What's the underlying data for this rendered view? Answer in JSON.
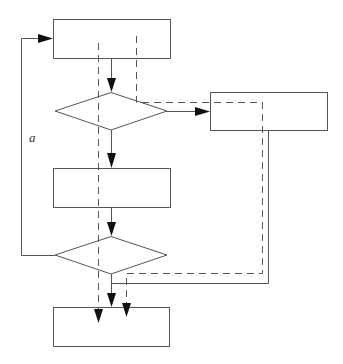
{
  "diagram": {
    "type": "flowchart",
    "width": 343,
    "height": 364,
    "colors": {
      "stroke": "#555555",
      "arrowhead": "#111111",
      "background": "#ffffff",
      "label": "#333333"
    },
    "nodes": [
      {
        "id": "process-1",
        "shape": "rectangle",
        "x": 53,
        "y": 19,
        "w": 117,
        "h": 39,
        "label": ""
      },
      {
        "id": "decision-1",
        "shape": "diamond",
        "cx": 111,
        "cy": 111,
        "w": 112,
        "h": 38,
        "label": ""
      },
      {
        "id": "process-side",
        "shape": "rectangle",
        "x": 210,
        "y": 92,
        "w": 117,
        "h": 38,
        "label": ""
      },
      {
        "id": "process-2",
        "shape": "rectangle",
        "x": 53,
        "y": 168,
        "w": 117,
        "h": 39,
        "label": ""
      },
      {
        "id": "decision-2",
        "shape": "diamond",
        "cx": 111,
        "cy": 255,
        "w": 112,
        "h": 38,
        "label": ""
      },
      {
        "id": "process-3",
        "shape": "rectangle",
        "x": 53,
        "y": 307,
        "w": 116,
        "h": 39,
        "label": ""
      }
    ],
    "edges": [
      {
        "id": "process1-to-decision1",
        "style": "solid",
        "arrow": true
      },
      {
        "id": "decision1-to-side",
        "style": "solid",
        "arrow": true
      },
      {
        "id": "decision1-to-process2",
        "style": "solid",
        "arrow": true
      },
      {
        "id": "process2-to-decision2",
        "style": "solid",
        "arrow": true
      },
      {
        "id": "decision2-loop-to-process1",
        "style": "solid",
        "arrow": true,
        "label": "a"
      },
      {
        "id": "decision2-to-process3",
        "style": "solid",
        "arrow": true
      },
      {
        "id": "side-to-process3",
        "style": "solid",
        "arrow": false
      },
      {
        "id": "dashed-path-left",
        "style": "dashed",
        "arrow": true
      },
      {
        "id": "dashed-path-right-loop",
        "style": "dashed",
        "arrow": true
      }
    ],
    "labels": {
      "loop_label": "a"
    }
  }
}
